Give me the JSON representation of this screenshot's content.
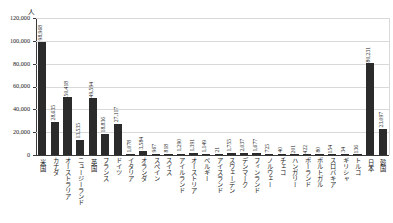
{
  "chart": {
    "title": "",
    "y_unit_label": "人",
    "colors": {
      "bar": "#2b2b2b",
      "grid": "#d9d9d9",
      "axis": "#3a3a3a",
      "text": "#1a1a1a"
    }
  },
  "chart_data": {
    "type": "bar",
    "title": "",
    "xlabel": "",
    "ylabel": "人",
    "ylim": [
      0,
      120000
    ],
    "ytick_labels": [
      "120,000",
      "100,000",
      "80,000",
      "60,000",
      "40,000",
      "20,000",
      "0"
    ],
    "ytick_values": [
      120000,
      100000,
      80000,
      60000,
      40000,
      20000,
      0
    ],
    "grid": true,
    "legend": false,
    "categories": [
      "米国",
      "カナダ",
      "オーストラリア",
      "ニュージーランド",
      "英国",
      "フランス",
      "ドイツ",
      "イタリア",
      "オランダ",
      "スペイン",
      "スイス",
      "アイルランド",
      "オーストリア",
      "ベルギー",
      "アイスランド",
      "スウェーデン",
      "デンマーク",
      "フィンランド",
      "ノルウェー",
      "チェコ",
      "ハンガリー",
      "ポーランド",
      "ポルトガル",
      "スロバキア",
      "ギリシャ",
      "トルコ",
      "日本",
      "韓国"
    ],
    "values": [
      98968,
      28635,
      50418,
      13535,
      49594,
      18836,
      27117,
      1078,
      3584,
      967,
      818,
      1290,
      1391,
      1149,
      21,
      1755,
      2037,
      1677,
      725,
      40,
      201,
      422,
      80,
      154,
      34,
      136,
      80231,
      23097
    ],
    "value_labels": [
      "98,968",
      "28,635",
      "50,418",
      "13,535",
      "49,594",
      "18,836",
      "27,117",
      "1,078",
      "3,584",
      "967",
      "818",
      "1,290",
      "1,391",
      "1,149",
      "21",
      "1,755",
      "2,037",
      "1,677",
      "725",
      "40",
      "201",
      "422",
      "80",
      "154",
      "34",
      "136",
      "80,231",
      "23,097"
    ]
  }
}
